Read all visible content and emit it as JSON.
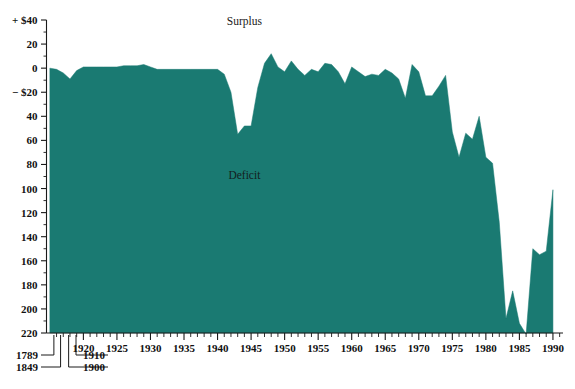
{
  "figure": {
    "background_color": "#ffffff",
    "series_color": "#1a7a72",
    "axis_color": "#1a1a1a",
    "annotations": {
      "surplus_label": "Surplus",
      "deficit_label": "Deficit"
    }
  },
  "chart_data": {
    "type": "area",
    "title": "",
    "subtitle": "",
    "xlabel": "",
    "ylabel": "",
    "grid": false,
    "legend_position": "none",
    "y_axis_note": "Values in billions of dollars; positive = surplus (plotted upward), deficit values increase downward",
    "ylim": [
      -40,
      220
    ],
    "yticks": [
      -40,
      -20,
      0,
      20,
      40,
      60,
      80,
      100,
      120,
      140,
      160,
      180,
      200,
      220
    ],
    "ytick_labels": [
      "+ $40",
      "20",
      "0",
      "− $20",
      "40",
      "60",
      "80",
      "100",
      "120",
      "140",
      "160",
      "180",
      "200",
      "220"
    ],
    "xlim": [
      1914.5,
      1991.5
    ],
    "xticks": [
      1920,
      1925,
      1930,
      1935,
      1940,
      1945,
      1950,
      1955,
      1960,
      1965,
      1970,
      1975,
      1980,
      1985,
      1990
    ],
    "xtick_labels": [
      "1920",
      "1925",
      "1930",
      "1935",
      "1940",
      "1945",
      "1950",
      "1955",
      "1960",
      "1965",
      "1970",
      "1975",
      "1980",
      "1985",
      "1990"
    ],
    "x_minor_tick_interval": 1,
    "early_axis_labels": [
      {
        "label": "1789",
        "x_position": 1915.6
      },
      {
        "label": "1849",
        "x_position": 1916.6
      },
      {
        "label": "1900",
        "x_position": 1917.8
      },
      {
        "label": "1910",
        "x_position": 1918.9
      }
    ],
    "x": [
      1915,
      1916,
      1917,
      1918,
      1919,
      1920,
      1921,
      1922,
      1923,
      1924,
      1925,
      1926,
      1927,
      1928,
      1929,
      1930,
      1931,
      1932,
      1933,
      1934,
      1935,
      1936,
      1937,
      1938,
      1939,
      1940,
      1941,
      1942,
      1943,
      1944,
      1945,
      1946,
      1947,
      1948,
      1949,
      1950,
      1951,
      1952,
      1953,
      1954,
      1955,
      1956,
      1957,
      1958,
      1959,
      1960,
      1961,
      1962,
      1963,
      1964,
      1965,
      1966,
      1967,
      1968,
      1969,
      1970,
      1971,
      1972,
      1973,
      1974,
      1975,
      1976,
      1977,
      1978,
      1979,
      1980,
      1981,
      1982,
      1983,
      1984,
      1985,
      1986,
      1987,
      1988,
      1989,
      1990
    ],
    "values": [
      0,
      -1,
      -4,
      -9,
      -2,
      1,
      1,
      1,
      1,
      1,
      1,
      2,
      2,
      2,
      3,
      1,
      -1,
      -1,
      -1,
      -1,
      -1,
      -1,
      -1,
      -1,
      -1,
      -1,
      -5,
      -20,
      -55,
      -48,
      -48,
      -16,
      4,
      12,
      1,
      -3,
      6,
      -1,
      -6,
      -1,
      -3,
      4,
      3,
      -3,
      -13,
      1,
      -3,
      -7,
      -5,
      -6,
      -1,
      -4,
      -9,
      -25,
      3,
      -3,
      -23,
      -23,
      -15,
      -6,
      -53,
      -74,
      -54,
      -59,
      -40,
      -74,
      -79,
      -128,
      -208,
      -185,
      -212,
      -221,
      -150,
      -155,
      -152,
      -101
    ],
    "annotations": [
      {
        "text": "Surplus",
        "x": 1944,
        "y": 36
      },
      {
        "text": "Deficit",
        "x": 1944,
        "y": -92
      }
    ]
  }
}
